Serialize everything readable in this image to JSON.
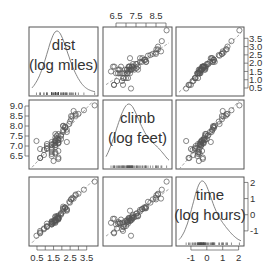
{
  "chart_data": {
    "type": "scatter",
    "subtype": "scatterplot-matrix",
    "variables": [
      {
        "name": "dist",
        "label_line1": "dist",
        "label_line2": "(log miles)",
        "range": [
          0.2,
          4.0
        ],
        "ticks": [
          0.5,
          1.5,
          2.5,
          3.5
        ],
        "minor_ticks": [
          1.0,
          2.0,
          3.0
        ],
        "tick_side": "bottom"
      },
      {
        "name": "climb",
        "label_line1": "climb",
        "label_line2": "(log feet)",
        "range": [
          6.0,
          9.15
        ],
        "ticks": [
          6.5,
          7.5,
          8.5
        ],
        "minor_ticks": [
          7.0,
          8.0,
          9.0
        ],
        "tick_side": "top"
      },
      {
        "name": "time",
        "label_line1": "time",
        "label_line2": "(log hours)",
        "range": [
          -1.75,
          2.15
        ],
        "ticks": [
          -1,
          0,
          1,
          2
        ],
        "tick_side": "bottom"
      }
    ],
    "axis_labels": {
      "top": [
        "6.5",
        "7.5",
        "8.5"
      ],
      "left": [
        "9.0",
        "8.5",
        "8.0",
        "7.5",
        "7.0",
        "6.5"
      ],
      "right_top": [
        "3.5",
        "3.0",
        "2.5",
        "2.0",
        "1.5",
        "1.0",
        "0.5"
      ],
      "right_bottom": [
        "2",
        "1",
        "0",
        "-1"
      ],
      "bottom_left": [
        "0.5",
        "1.5",
        "2.5",
        "3.5"
      ],
      "bottom_right": [
        "-1",
        "0",
        "1",
        "2"
      ]
    },
    "diagonal": "density curve with rug",
    "off_diagonal": "scatter with dashed regression line",
    "points": {
      "dist": [
        0.92,
        1.1,
        0.69,
        1.61,
        1.95,
        1.79,
        1.39,
        1.79,
        2.3,
        1.1,
        1.61,
        1.39,
        1.61,
        1.7,
        1.79,
        2.08,
        2.2,
        2.56,
        1.79,
        0.69,
        1.39,
        2.83,
        0.92,
        1.61,
        1.5,
        1.79,
        1.95,
        1.61,
        2.3,
        1.39,
        1.61,
        2.08,
        3.33,
        2.2,
        1.7,
        2.49,
        2.71,
        1.39,
        1.79,
        1.61,
        1.39,
        1.79,
        2.56,
        3.0,
        2.08,
        1.61,
        1.79,
        1.95,
        2.2,
        1.1,
        0.69,
        2.3,
        1.61,
        0.47,
        1.5,
        1.79,
        1.1,
        2.64,
        1.39,
        1.61,
        2.08,
        2.83,
        2.45,
        3.98,
        1.79,
        1.39,
        1.61
      ],
      "climb": [
        6.55,
        7.1,
        6.4,
        7.24,
        7.55,
        7.31,
        7.09,
        7.31,
        7.82,
        6.85,
        6.68,
        7.2,
        7.6,
        7.35,
        7.6,
        8.01,
        7.97,
        8.34,
        7.16,
        6.4,
        6.6,
        8.52,
        6.8,
        7.24,
        7.1,
        7.13,
        7.5,
        6.62,
        7.7,
        6.7,
        7.05,
        8.0,
        8.79,
        7.9,
        7.52,
        8.22,
        8.75,
        6.5,
        7.17,
        7.42,
        6.8,
        6.75,
        8.5,
        8.6,
        7.8,
        6.95,
        7.28,
        7.35,
        7.95,
        6.9,
        6.85,
        7.2,
        7.3,
        7.25,
        6.25,
        6.42,
        7.0,
        8.48,
        7.05,
        7.15,
        7.7,
        8.6,
        8.1,
        9.03,
        6.35,
        6.9,
        7.05
      ],
      "time": [
        -0.85,
        -0.55,
        -1.1,
        -0.35,
        0.1,
        -0.1,
        -0.45,
        -0.2,
        0.35,
        -0.75,
        -0.5,
        -0.4,
        -0.1,
        -0.2,
        -0.05,
        0.5,
        0.45,
        0.95,
        -0.25,
        -1.15,
        -0.55,
        1.2,
        -0.9,
        -0.3,
        -0.4,
        -0.2,
        0.05,
        -0.45,
        0.3,
        -0.55,
        -0.35,
        0.4,
        1.55,
        0.45,
        -0.1,
        0.75,
        1.0,
        -0.6,
        -0.2,
        -0.15,
        -0.5,
        -0.3,
        0.95,
        1.3,
        0.35,
        -0.4,
        -0.15,
        0.0,
        0.4,
        -0.75,
        -1.0,
        0.25,
        -0.3,
        -1.3,
        -0.5,
        -0.25,
        -0.7,
        1.05,
        -0.45,
        -0.35,
        0.2,
        1.25,
        0.8,
        2.05,
        -0.25,
        -0.6,
        -0.35
      ]
    },
    "grid": false,
    "legend": null,
    "title": ""
  },
  "style": {
    "point_color": "#555555",
    "line_color": "#777777",
    "frame_color": "#555555",
    "text_color": "#333333"
  }
}
